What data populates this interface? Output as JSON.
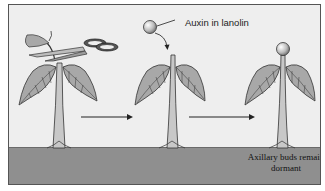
{
  "diagram": {
    "type": "three-step process illustration",
    "steps": [
      {
        "id": "step-1",
        "description": "Plant with apical bud being cut off by scissors"
      },
      {
        "id": "step-2",
        "description": "Decapitated stem receiving lanolin bead containing auxin"
      },
      {
        "id": "step-3",
        "description": "Stem with auxin-lanolin bead on top; axillary buds stay dormant"
      }
    ],
    "labels": {
      "auxin": "Auxin in lanolin",
      "result": "Axillary buds remain dormant"
    },
    "colors": {
      "background": "#eeeeee",
      "ground": "#8f8f8f",
      "leaf": "#a8a8a8",
      "stem": "#c8c8c8",
      "outline": "#333333"
    }
  }
}
